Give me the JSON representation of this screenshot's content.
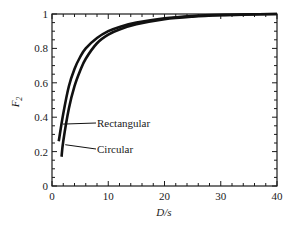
{
  "chart_data": {
    "type": "line",
    "title": "",
    "xlabel": "D/s",
    "ylabel": "F_2",
    "ylabel_main": "F",
    "ylabel_sub": "2",
    "xlim": [
      0,
      40
    ],
    "ylim": [
      0,
      1
    ],
    "xticks": [
      0,
      10,
      20,
      30,
      40
    ],
    "xtick_labels": [
      "0",
      "10",
      "20",
      "30",
      "40"
    ],
    "yticks": [
      0,
      0.2,
      0.4,
      0.6,
      0.8,
      1
    ],
    "ytick_labels": [
      "0",
      "0.2",
      "0.4",
      "0.6",
      "0.8",
      "1"
    ],
    "grid": false,
    "legend": "none (inline annotations)",
    "series": [
      {
        "name": "Rectangular",
        "x": [
          1.2,
          2,
          3,
          4,
          5,
          6,
          8,
          10,
          12,
          15,
          20,
          25,
          30,
          35,
          40
        ],
        "y": [
          0.26,
          0.42,
          0.58,
          0.68,
          0.75,
          0.8,
          0.86,
          0.9,
          0.925,
          0.95,
          0.975,
          0.988,
          0.995,
          0.998,
          1.0
        ]
      },
      {
        "name": "Circular",
        "x": [
          1.7,
          2,
          3,
          4,
          5,
          6,
          8,
          10,
          12,
          15,
          20,
          25,
          30,
          35,
          40
        ],
        "y": [
          0.17,
          0.26,
          0.45,
          0.58,
          0.67,
          0.74,
          0.83,
          0.88,
          0.91,
          0.94,
          0.97,
          0.985,
          0.993,
          0.997,
          1.0
        ]
      }
    ],
    "annotations": [
      {
        "text": "Rectangular",
        "points_to_x": 1.6,
        "points_to_y": 0.36
      },
      {
        "text": "Circular",
        "points_to_x": 2.0,
        "points_to_y": 0.24
      }
    ]
  }
}
